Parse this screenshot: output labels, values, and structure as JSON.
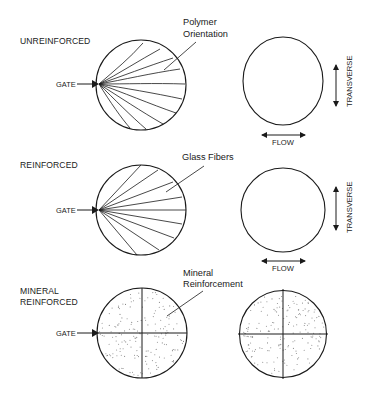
{
  "diagram": {
    "rows": [
      {
        "id": "unreinforced",
        "label_lines": [
          "UNREINFORCED"
        ],
        "gate_label": "GATE",
        "callout_lines": [
          "Polymer",
          "Orientation"
        ],
        "pattern": "wavy-radial-lines",
        "right_shape": "ellipse-elongated-transverse",
        "flow_label": "FLOW",
        "transverse_label": "TRANSVERSE"
      },
      {
        "id": "reinforced",
        "label_lines": [
          "REINFORCED"
        ],
        "gate_label": "GATE",
        "callout_lines": [
          "Glass Fibers"
        ],
        "pattern": "straight-radial-lines",
        "right_shape": "circle",
        "flow_label": "FLOW",
        "transverse_label": "TRANSVERSE"
      },
      {
        "id": "mineral-reinforced",
        "label_lines": [
          "MINERAL",
          "REINFORCED"
        ],
        "gate_label": "GATE",
        "callout_lines": [
          "Mineral",
          "Reinforcement"
        ],
        "pattern": "stippled-quadrants",
        "right_shape": "circle-with-cross"
      }
    ],
    "colors": {
      "ink": "#1a1a1a",
      "stipple": "#8a8a8a",
      "background": "#ffffff"
    }
  }
}
